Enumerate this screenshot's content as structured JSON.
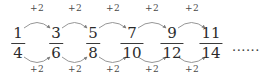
{
  "diagram": {
    "type": "number-sequence-arc-diagram",
    "stroke_color": "#8a8a8a",
    "text_color": "#2b2b2b",
    "background_color": "#ffffff",
    "terms": [
      {
        "numerator": "1",
        "denominator": "4",
        "x": 18
      },
      {
        "numerator": "3",
        "denominator": "6",
        "x": 56
      },
      {
        "numerator": "5",
        "denominator": "8",
        "x": 93
      },
      {
        "numerator": "7",
        "denominator": "10",
        "x": 132
      },
      {
        "numerator": "9",
        "denominator": "12",
        "x": 172
      },
      {
        "numerator": "11",
        "denominator": "14",
        "x": 211
      }
    ],
    "top_arcs": [
      {
        "label": "+2",
        "x": 37
      },
      {
        "label": "+2",
        "x": 75
      },
      {
        "label": "+2",
        "x": 113
      },
      {
        "label": "+2",
        "x": 152
      },
      {
        "label": "+2",
        "x": 192
      }
    ],
    "bottom_arcs": [
      {
        "label": "+2",
        "x": 37
      },
      {
        "label": "+2",
        "x": 75
      },
      {
        "label": "+2",
        "x": 113
      },
      {
        "label": "+2",
        "x": 152
      },
      {
        "label": "+2",
        "x": 192
      }
    ],
    "ellipsis": {
      "text": "......",
      "x": 232,
      "y": 40
    }
  }
}
